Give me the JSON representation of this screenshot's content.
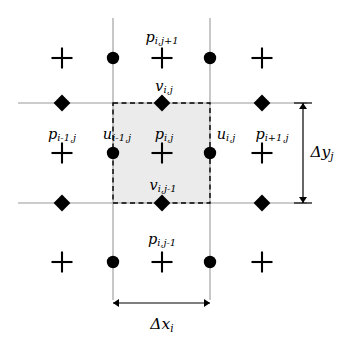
{
  "figure": {
    "type": "staggered-mac-grid-diagram",
    "title": ""
  },
  "geometry": {
    "width": 343,
    "height": 341,
    "columns_x": [
      62,
      113,
      162,
      210,
      262
    ],
    "rows_y": [
      58,
      103,
      153,
      203,
      262
    ],
    "gridlines": {
      "horizontal_y": [
        103,
        203
      ],
      "vertical_x": [
        113,
        210
      ],
      "horizontal_extent": [
        18,
        307
      ],
      "vertical_extent": [
        18,
        300
      ]
    },
    "cell": {
      "x": 113,
      "y": 103,
      "width": 97,
      "height": 100
    }
  },
  "colors": {
    "background": "#ffffff",
    "gridline": "#9a9a9a",
    "marker": "#000000",
    "cell_fill": "#ebebeb",
    "cell_border": "#000000",
    "dimension_line": "#000000"
  },
  "markers": {
    "pressure_symbol": "plus",
    "u_velocity_symbol": "circle",
    "v_velocity_symbol": "diamond",
    "pressure_nodes": [
      {
        "x": 62,
        "y": 58
      },
      {
        "x": 162,
        "y": 58
      },
      {
        "x": 262,
        "y": 58
      },
      {
        "x": 62,
        "y": 153
      },
      {
        "x": 162,
        "y": 153
      },
      {
        "x": 262,
        "y": 153
      },
      {
        "x": 62,
        "y": 262
      },
      {
        "x": 162,
        "y": 262
      },
      {
        "x": 262,
        "y": 262
      }
    ],
    "u_nodes": [
      {
        "x": 113,
        "y": 58
      },
      {
        "x": 210,
        "y": 58
      },
      {
        "x": 113,
        "y": 153
      },
      {
        "x": 210,
        "y": 153
      },
      {
        "x": 113,
        "y": 262
      },
      {
        "x": 210,
        "y": 262
      }
    ],
    "v_nodes": [
      {
        "x": 62,
        "y": 103
      },
      {
        "x": 162,
        "y": 103
      },
      {
        "x": 262,
        "y": 103
      },
      {
        "x": 62,
        "y": 203
      },
      {
        "x": 162,
        "y": 203
      },
      {
        "x": 262,
        "y": 203
      }
    ]
  },
  "labels": {
    "p_i_jp1": {
      "base": "p",
      "sub": "i,j+1",
      "x": 162,
      "y": 38
    },
    "v_i_j": {
      "base": "v",
      "sub": "i,j",
      "x": 164,
      "y": 87
    },
    "p_im1_j": {
      "base": "p",
      "sub": "i-1,j",
      "x": 62,
      "y": 135
    },
    "u_im1_j": {
      "base": "u",
      "sub": "i-1,j",
      "x": 117,
      "y": 135
    },
    "p_i_j": {
      "base": "p",
      "sub": "i,j",
      "x": 164,
      "y": 135
    },
    "u_i_j": {
      "base": "u",
      "sub": "i,j",
      "x": 226,
      "y": 135
    },
    "p_ip1_j": {
      "base": "p",
      "sub": "i+1,j",
      "x": 272,
      "y": 135
    },
    "v_i_jm1": {
      "base": "v",
      "sub": "i,j-1",
      "x": 163,
      "y": 186
    },
    "p_i_jm1": {
      "base": "p",
      "sub": "i,j-1",
      "x": 162,
      "y": 240
    },
    "delta_y": {
      "base": "Δy",
      "sub": "j",
      "x": 322,
      "y": 153
    },
    "delta_x": {
      "base": "Δx",
      "sub": "i",
      "x": 162,
      "y": 325
    }
  },
  "dimensions": {
    "vertical": {
      "name": "delta-y-j",
      "label_base": "Δy",
      "label_sub": "j",
      "x": 303,
      "from_y": 103,
      "to_y": 203
    },
    "horizontal": {
      "name": "delta-x-i",
      "label_base": "Δx",
      "label_sub": "i",
      "y": 303,
      "from_x": 113,
      "to_x": 210
    }
  }
}
